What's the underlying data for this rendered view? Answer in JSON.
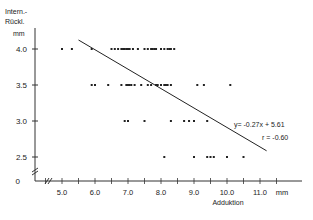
{
  "chart_data": {
    "type": "scatter",
    "title": "",
    "xlabel": "Adduktion",
    "x_unit": "mm",
    "ylabel_lines": [
      "Intern.-",
      "Rückl."
    ],
    "y_unit": "mm",
    "xlim": [
      4.0,
      11.3
    ],
    "ylim": [
      0,
      4.2
    ],
    "x_ticks": [
      5.0,
      6.0,
      7.0,
      8.0,
      9.0,
      10.0,
      11.0
    ],
    "x_tick_labels": [
      "5.0",
      "6.0",
      "7.0",
      "8.0",
      "9.0",
      "10.0",
      "11.0"
    ],
    "y_ticks": [
      0,
      2.5,
      3.0,
      3.5,
      4.0
    ],
    "y_tick_labels": [
      "0",
      "2.5",
      "3.0",
      "3.5",
      "4.0"
    ],
    "axis_breaks": true,
    "grid": false,
    "regression": {
      "equation": "y= -0.27x + 5.61",
      "r_label": "r = -0.60",
      "slope": -0.27,
      "intercept": 5.61,
      "x_range": [
        5.5,
        11.2
      ]
    },
    "series": [
      {
        "name": "y=4.0",
        "y": 4.0,
        "x": [
          5.0,
          5.3,
          5.9,
          6.5,
          6.6,
          6.7,
          6.8,
          6.85,
          6.9,
          6.95,
          7.0,
          7.05,
          7.15,
          7.3,
          7.5,
          7.6,
          7.7,
          7.75,
          7.8,
          7.85,
          8.0,
          8.1,
          8.2,
          8.25,
          8.3,
          8.4
        ]
      },
      {
        "name": "y=3.5",
        "y": 3.5,
        "x": [
          5.9,
          6.0,
          6.4,
          6.8,
          6.95,
          7.0,
          7.05,
          7.1,
          7.2,
          7.4,
          7.6,
          7.7,
          7.85,
          7.9,
          8.0,
          8.1,
          8.15,
          8.2,
          8.3,
          9.1,
          9.3,
          10.1
        ]
      },
      {
        "name": "y=3.0",
        "y": 3.0,
        "x": [
          6.9,
          7.0,
          7.5,
          8.3,
          8.7,
          8.85,
          9.0,
          9.4
        ]
      },
      {
        "name": "y=2.5",
        "y": 2.5,
        "x": [
          8.1,
          9.0,
          9.4,
          9.5,
          9.6,
          10.0,
          10.5
        ]
      }
    ]
  }
}
